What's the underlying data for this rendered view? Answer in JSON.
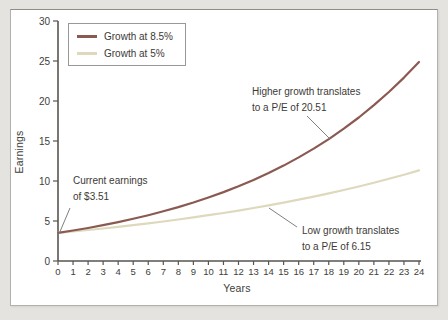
{
  "page": {
    "background_color": "#e5e3df",
    "panel_background": "#ffffff"
  },
  "chart_data": {
    "type": "line",
    "title": "",
    "xlabel": "Years",
    "ylabel": "Earnings",
    "xlim": [
      0,
      24
    ],
    "ylim": [
      0,
      30
    ],
    "grid": false,
    "legend_position": "top-left",
    "x_ticks": [
      0,
      1,
      2,
      3,
      4,
      5,
      6,
      7,
      8,
      9,
      10,
      11,
      12,
      13,
      14,
      15,
      16,
      17,
      18,
      19,
      20,
      21,
      22,
      23,
      24
    ],
    "y_ticks": [
      0,
      5,
      10,
      15,
      20,
      25,
      30
    ],
    "x": [
      0,
      1,
      2,
      3,
      4,
      5,
      6,
      7,
      8,
      9,
      10,
      11,
      12,
      13,
      14,
      15,
      16,
      17,
      18,
      19,
      20,
      21,
      22,
      23,
      24
    ],
    "series": [
      {
        "name": "Growth at 8.5%",
        "growth_rate_percent": 8.5,
        "start_value": 3.51,
        "color": "#8a5a52",
        "values": [
          3.51,
          3.81,
          4.13,
          4.48,
          4.86,
          5.28,
          5.73,
          6.21,
          6.74,
          7.31,
          7.94,
          8.61,
          9.34,
          10.14,
          11.0,
          11.93,
          12.95,
          14.05,
          15.24,
          16.54,
          17.94,
          19.47,
          21.12,
          22.92,
          24.87
        ]
      },
      {
        "name": "Growth at 5%",
        "growth_rate_percent": 5,
        "start_value": 3.51,
        "color": "#ded9bd",
        "values": [
          3.51,
          3.69,
          3.87,
          4.06,
          4.27,
          4.48,
          4.7,
          4.94,
          5.19,
          5.45,
          5.72,
          6.0,
          6.3,
          6.62,
          6.95,
          7.3,
          7.66,
          8.05,
          8.45,
          8.87,
          9.31,
          9.78,
          10.27,
          10.78,
          11.32
        ]
      }
    ],
    "annotations": [
      {
        "id": "current-earnings",
        "lines": [
          "Current earnings",
          "of $3.51"
        ]
      },
      {
        "id": "higher-growth",
        "lines": [
          "Higher growth translates",
          "to a P/E of 20.51"
        ]
      },
      {
        "id": "low-growth",
        "lines": [
          "Low growth translates",
          "to a P/E of 6.15"
        ]
      }
    ],
    "colors": {
      "axis": "#57554f",
      "tick_text": "#403e3a",
      "annotation_pointer": "#827f7b"
    }
  }
}
